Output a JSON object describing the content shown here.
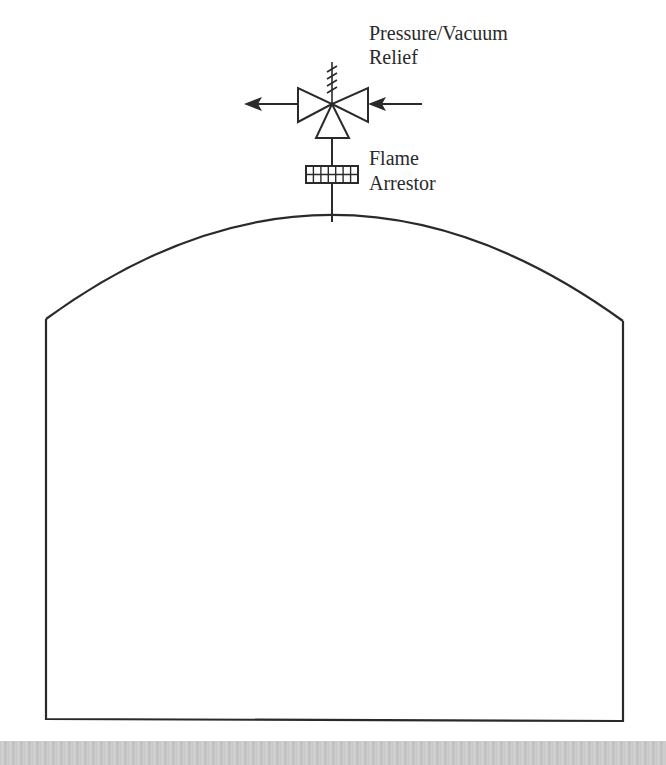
{
  "diagram": {
    "labels": {
      "relief_line1": "Pressure/Vacuum",
      "relief_line2": "Relief",
      "arrestor_line1": "Flame",
      "arrestor_line2": "Arrestor"
    },
    "components": [
      {
        "name": "tank",
        "shape": "dome-roof-rectangle"
      },
      {
        "name": "pressure-vacuum-relief-valve",
        "shape": "three-way-valve-with-spring"
      },
      {
        "name": "flame-arrestor",
        "shape": "grid-block",
        "grid": {
          "cols": 7,
          "rows": 2
        }
      },
      {
        "name": "outflow-arrow",
        "direction": "left"
      },
      {
        "name": "inflow-arrow",
        "direction": "left"
      }
    ],
    "colors": {
      "line": "#2a2a2a",
      "background": "#ffffff",
      "band": "#c8c8c8"
    }
  }
}
